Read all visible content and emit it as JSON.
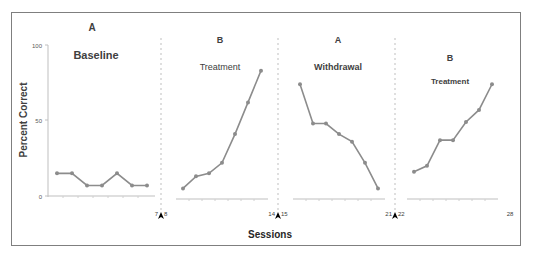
{
  "chart_data": {
    "type": "line",
    "title": "",
    "xlabel": "Sessions",
    "ylabel": "Percent Correct",
    "ylim": [
      0,
      100
    ],
    "yticks": [
      0,
      50,
      100
    ],
    "grid": false,
    "legend": null,
    "phases": [
      {
        "letter": "A",
        "name": "Baseline",
        "sessions": [
          1,
          2,
          3,
          4,
          5,
          6,
          7
        ],
        "values": [
          15,
          15,
          7,
          7,
          15,
          7,
          7
        ],
        "start_label": "",
        "end_label": "7"
      },
      {
        "letter": "B",
        "name": "Treatment",
        "sessions": [
          8,
          9,
          10,
          11,
          12,
          13,
          14
        ],
        "values": [
          5,
          13,
          15,
          22,
          41,
          62,
          83
        ],
        "start_label": "8",
        "end_label": "14"
      },
      {
        "letter": "A",
        "name": "Withdrawal",
        "sessions": [
          15,
          16,
          17,
          18,
          19,
          20,
          21
        ],
        "values": [
          74,
          48,
          48,
          41,
          36,
          22,
          5
        ],
        "start_label": "15",
        "end_label": "21"
      },
      {
        "letter": "B",
        "name": "Treatment",
        "sessions": [
          22,
          23,
          24,
          25,
          26,
          27,
          28
        ],
        "values": [
          16,
          20,
          37,
          37,
          49,
          57,
          74
        ],
        "start_label": "22",
        "end_label": "28"
      }
    ],
    "phase_change_markers": [
      "^",
      "^",
      "^"
    ],
    "line_color": "#8c8c8c",
    "marker_color": "#8c8c8c",
    "axis_color": "#bfbfbf",
    "phase_line_color": "#bfbfbf"
  },
  "labels": {
    "ylabel": "Percent Correct",
    "xlabel": "Sessions",
    "y0": "0",
    "y50": "50",
    "y100": "100",
    "p1_letter": "A",
    "p1_name": "Baseline",
    "p1_end": "7",
    "p2_letter": "B",
    "p2_name": "Treatment",
    "p2_start": "8",
    "p2_end": "14",
    "p3_letter": "A",
    "p3_name": "Withdrawal",
    "p3_start": "15",
    "p3_end": "21",
    "p4_letter": "B",
    "p4_name": "Treatment",
    "p4_start": "22",
    "p4_end": "28"
  }
}
